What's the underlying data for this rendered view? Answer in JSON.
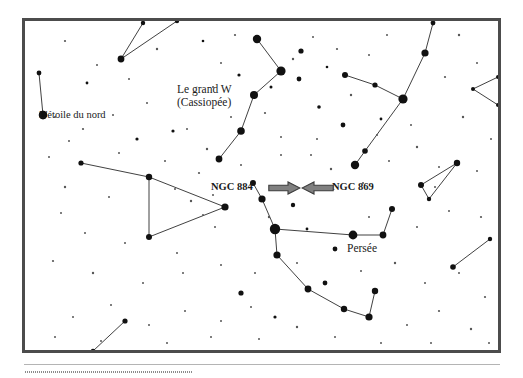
{
  "figure": {
    "kind": "star-chart",
    "language": "fr",
    "frame_border_color": "#4c4c4c",
    "background_color": "#ffffff",
    "star_color": "#111111",
    "constellation_line_color": "#2b2b2b",
    "arrow_fill_color": "#808080",
    "arrow_stroke_color": "#3c3c3c"
  },
  "labels": {
    "polaris": "L'étoile du nord",
    "cassiopeia_line1": "Le grand W",
    "cassiopeia_line2": "(Cassiopée)",
    "perseus": "Persée",
    "ngc884": "NGC 884",
    "ngc869": "NGC 869"
  },
  "chart_data": {
    "type": "scatter",
    "title": "",
    "subtitle": "",
    "xlabel": "",
    "ylabel": "",
    "xlim": [
      0,
      473
    ],
    "ylim": [
      0,
      329
    ],
    "grid": false,
    "legend": "none",
    "annotations": [
      {
        "text": "L'étoile du nord",
        "x": 18,
        "y": 86,
        "anchor": "star-polaris"
      },
      {
        "text": "Le grand W",
        "x": 140,
        "y": 60,
        "anchor": "constellation-cassiopeia"
      },
      {
        "text": "(Cassiopée)",
        "x": 140,
        "y": 74,
        "anchor": "constellation-cassiopeia"
      },
      {
        "text": "Persée",
        "x": 308,
        "y": 220,
        "anchor": "constellation-perseus"
      },
      {
        "text": "NGC 884",
        "x": 172,
        "y": 160,
        "anchor": "arrow-right"
      },
      {
        "text": "NGC 869",
        "x": 292,
        "y": 160,
        "anchor": "arrow-left"
      }
    ],
    "markers": {
      "named_stars": [
        {
          "name": "Polaris",
          "label": "L'étoile du nord",
          "x": 18,
          "y": 94,
          "size": 4.2
        }
      ]
    },
    "series": [
      {
        "name": "Cassiopée",
        "type": "constellation",
        "stars": [
          {
            "x": 232,
            "y": 18,
            "size": 4.2
          },
          {
            "x": 256,
            "y": 50,
            "size": 4.6
          },
          {
            "x": 229,
            "y": 74,
            "size": 4.0
          },
          {
            "x": 216,
            "y": 110,
            "size": 3.8
          },
          {
            "x": 194,
            "y": 138,
            "size": 3.4
          }
        ],
        "lines": [
          [
            0,
            1
          ],
          [
            1,
            2
          ],
          [
            2,
            3
          ],
          [
            3,
            4
          ]
        ]
      },
      {
        "name": "Persée",
        "type": "constellation",
        "stars": [
          {
            "x": 228,
            "y": 162,
            "size": 3.0
          },
          {
            "x": 237,
            "y": 178,
            "size": 3.6
          },
          {
            "x": 250,
            "y": 208,
            "size": 5.2
          },
          {
            "x": 328,
            "y": 214,
            "size": 4.4
          },
          {
            "x": 358,
            "y": 214,
            "size": 3.4
          },
          {
            "x": 367,
            "y": 188,
            "size": 3.0
          },
          {
            "x": 252,
            "y": 234,
            "size": 3.6
          },
          {
            "x": 283,
            "y": 268,
            "size": 3.4
          },
          {
            "x": 319,
            "y": 288,
            "size": 3.2
          },
          {
            "x": 344,
            "y": 296,
            "size": 3.6
          },
          {
            "x": 350,
            "y": 270,
            "size": 3.2
          }
        ],
        "lines": [
          [
            0,
            1
          ],
          [
            1,
            2
          ],
          [
            2,
            3
          ],
          [
            3,
            4
          ],
          [
            4,
            5
          ],
          [
            2,
            6
          ],
          [
            6,
            7
          ],
          [
            7,
            8
          ],
          [
            8,
            9
          ],
          [
            9,
            10
          ]
        ]
      },
      {
        "name": "Andromède",
        "type": "constellation",
        "stars": [
          {
            "x": 56,
            "y": 142,
            "size": 2.6
          },
          {
            "x": 124,
            "y": 156,
            "size": 3.2
          },
          {
            "x": 200,
            "y": 186,
            "size": 3.6
          },
          {
            "x": 124,
            "y": 216,
            "size": 3.0
          }
        ],
        "lines": [
          [
            0,
            1
          ],
          [
            1,
            2
          ],
          [
            2,
            3
          ],
          [
            3,
            1
          ]
        ]
      },
      {
        "name": "Nord-ouest",
        "type": "constellation",
        "stars": [
          {
            "x": 14,
            "y": 52,
            "size": 2.4
          },
          {
            "x": 18,
            "y": 94,
            "size": 4.2
          }
        ],
        "lines": [
          [
            0,
            1
          ]
        ]
      },
      {
        "name": "Haut-centre",
        "type": "constellation",
        "stars": [
          {
            "x": 118,
            "y": 2,
            "size": 2.2
          },
          {
            "x": 96,
            "y": 38,
            "size": 3.4
          },
          {
            "x": 152,
            "y": 0,
            "size": 2.2
          }
        ],
        "lines": [
          [
            0,
            1
          ],
          [
            1,
            2
          ]
        ]
      },
      {
        "name": "Nord-est",
        "type": "constellation",
        "stars": [
          {
            "x": 408,
            "y": 2,
            "size": 2.4
          },
          {
            "x": 400,
            "y": 32,
            "size": 3.6
          },
          {
            "x": 378,
            "y": 78,
            "size": 4.6
          },
          {
            "x": 340,
            "y": 130,
            "size": 2.8
          },
          {
            "x": 330,
            "y": 144,
            "size": 4.2
          },
          {
            "x": 320,
            "y": 54,
            "size": 3.0
          },
          {
            "x": 350,
            "y": 64,
            "size": 2.6
          }
        ],
        "lines": [
          [
            0,
            1
          ],
          [
            1,
            2
          ],
          [
            2,
            3
          ],
          [
            3,
            4
          ],
          [
            2,
            6
          ],
          [
            6,
            5
          ]
        ]
      },
      {
        "name": "Est-triangle",
        "type": "constellation",
        "stars": [
          {
            "x": 432,
            "y": 142,
            "size": 3.2
          },
          {
            "x": 396,
            "y": 164,
            "size": 3.0
          },
          {
            "x": 404,
            "y": 178,
            "size": 2.2
          }
        ],
        "lines": [
          [
            0,
            1
          ],
          [
            1,
            2
          ],
          [
            2,
            0
          ]
        ]
      },
      {
        "name": "Est-bas",
        "type": "constellation",
        "stars": [
          {
            "x": 465,
            "y": 218,
            "size": 2.2
          },
          {
            "x": 428,
            "y": 246,
            "size": 2.8
          }
        ],
        "lines": [
          [
            0,
            1
          ]
        ]
      },
      {
        "name": "Sud-ouest",
        "type": "constellation",
        "stars": [
          {
            "x": 100,
            "y": 300,
            "size": 2.6
          },
          {
            "x": 68,
            "y": 330,
            "size": 2.2
          }
        ],
        "lines": [
          [
            0,
            1
          ]
        ]
      },
      {
        "name": "Est-bord",
        "type": "constellation",
        "stars": [
          {
            "x": 473,
            "y": 56,
            "size": 2.0
          },
          {
            "x": 448,
            "y": 68,
            "size": 2.0
          },
          {
            "x": 473,
            "y": 84,
            "size": 2.0
          }
        ],
        "lines": [
          [
            0,
            1
          ],
          [
            1,
            2
          ]
        ]
      }
    ],
    "background_stars": [
      {
        "x": 40,
        "y": 20,
        "size": 1.1
      },
      {
        "x": 72,
        "y": 44,
        "size": 1.0
      },
      {
        "x": 62,
        "y": 62,
        "size": 1.4
      },
      {
        "x": 104,
        "y": 58,
        "size": 1.0
      },
      {
        "x": 132,
        "y": 28,
        "size": 1.2
      },
      {
        "x": 178,
        "y": 20,
        "size": 1.3
      },
      {
        "x": 196,
        "y": 42,
        "size": 1.0
      },
      {
        "x": 210,
        "y": 14,
        "size": 1.1
      },
      {
        "x": 214,
        "y": 54,
        "size": 1.6
      },
      {
        "x": 246,
        "y": 66,
        "size": 1.5
      },
      {
        "x": 268,
        "y": 38,
        "size": 1.2
      },
      {
        "x": 274,
        "y": 58,
        "size": 2.4
      },
      {
        "x": 288,
        "y": 16,
        "size": 1.0
      },
      {
        "x": 276,
        "y": 30,
        "size": 2.6
      },
      {
        "x": 302,
        "y": 46,
        "size": 1.3
      },
      {
        "x": 312,
        "y": 28,
        "size": 1.1
      },
      {
        "x": 326,
        "y": 74,
        "size": 1.2
      },
      {
        "x": 294,
        "y": 86,
        "size": 1.8
      },
      {
        "x": 318,
        "y": 104,
        "size": 2.4
      },
      {
        "x": 356,
        "y": 98,
        "size": 1.4
      },
      {
        "x": 386,
        "y": 104,
        "size": 1.0
      },
      {
        "x": 420,
        "y": 56,
        "size": 1.1
      },
      {
        "x": 438,
        "y": 96,
        "size": 1.2
      },
      {
        "x": 452,
        "y": 42,
        "size": 1.0
      },
      {
        "x": 466,
        "y": 118,
        "size": 1.0
      },
      {
        "x": 30,
        "y": 96,
        "size": 1.0
      },
      {
        "x": 58,
        "y": 108,
        "size": 1.1
      },
      {
        "x": 88,
        "y": 94,
        "size": 1.0
      },
      {
        "x": 112,
        "y": 118,
        "size": 1.6
      },
      {
        "x": 148,
        "y": 110,
        "size": 1.6
      },
      {
        "x": 162,
        "y": 108,
        "size": 1.0
      },
      {
        "x": 182,
        "y": 128,
        "size": 1.2
      },
      {
        "x": 206,
        "y": 96,
        "size": 1.0
      },
      {
        "x": 240,
        "y": 92,
        "size": 1.1
      },
      {
        "x": 256,
        "y": 116,
        "size": 1.0
      },
      {
        "x": 174,
        "y": 152,
        "size": 1.1
      },
      {
        "x": 140,
        "y": 140,
        "size": 1.0
      },
      {
        "x": 94,
        "y": 132,
        "size": 1.0
      },
      {
        "x": 24,
        "y": 136,
        "size": 1.0
      },
      {
        "x": 40,
        "y": 166,
        "size": 1.2
      },
      {
        "x": 84,
        "y": 176,
        "size": 1.0
      },
      {
        "x": 150,
        "y": 168,
        "size": 1.0
      },
      {
        "x": 166,
        "y": 180,
        "size": 1.2
      },
      {
        "x": 178,
        "y": 194,
        "size": 1.0
      },
      {
        "x": 188,
        "y": 174,
        "size": 1.0
      },
      {
        "x": 216,
        "y": 144,
        "size": 1.0
      },
      {
        "x": 306,
        "y": 148,
        "size": 1.2
      },
      {
        "x": 338,
        "y": 162,
        "size": 1.0
      },
      {
        "x": 364,
        "y": 140,
        "size": 1.0
      },
      {
        "x": 392,
        "y": 126,
        "size": 1.2
      },
      {
        "x": 414,
        "y": 146,
        "size": 1.0
      },
      {
        "x": 452,
        "y": 150,
        "size": 1.0
      },
      {
        "x": 268,
        "y": 184,
        "size": 2.2
      },
      {
        "x": 244,
        "y": 196,
        "size": 1.2
      },
      {
        "x": 282,
        "y": 208,
        "size": 1.4
      },
      {
        "x": 310,
        "y": 228,
        "size": 2.4
      },
      {
        "x": 344,
        "y": 196,
        "size": 1.0
      },
      {
        "x": 392,
        "y": 206,
        "size": 1.0
      },
      {
        "x": 424,
        "y": 190,
        "size": 1.0
      },
      {
        "x": 456,
        "y": 196,
        "size": 1.1
      },
      {
        "x": 190,
        "y": 206,
        "size": 1.0
      },
      {
        "x": 152,
        "y": 232,
        "size": 1.0
      },
      {
        "x": 100,
        "y": 222,
        "size": 1.0
      },
      {
        "x": 60,
        "y": 212,
        "size": 1.0
      },
      {
        "x": 36,
        "y": 192,
        "size": 1.0
      },
      {
        "x": 28,
        "y": 240,
        "size": 1.1
      },
      {
        "x": 68,
        "y": 252,
        "size": 1.2
      },
      {
        "x": 118,
        "y": 262,
        "size": 1.0
      },
      {
        "x": 158,
        "y": 252,
        "size": 1.0
      },
      {
        "x": 196,
        "y": 244,
        "size": 1.0
      },
      {
        "x": 230,
        "y": 252,
        "size": 1.0
      },
      {
        "x": 216,
        "y": 272,
        "size": 2.6
      },
      {
        "x": 272,
        "y": 242,
        "size": 1.0
      },
      {
        "x": 300,
        "y": 262,
        "size": 2.4
      },
      {
        "x": 336,
        "y": 250,
        "size": 1.0
      },
      {
        "x": 370,
        "y": 242,
        "size": 1.2
      },
      {
        "x": 400,
        "y": 262,
        "size": 1.0
      },
      {
        "x": 434,
        "y": 252,
        "size": 1.0
      },
      {
        "x": 460,
        "y": 276,
        "size": 1.1
      },
      {
        "x": 250,
        "y": 296,
        "size": 1.6
      },
      {
        "x": 226,
        "y": 286,
        "size": 1.0
      },
      {
        "x": 196,
        "y": 300,
        "size": 1.0
      },
      {
        "x": 160,
        "y": 290,
        "size": 1.0
      },
      {
        "x": 124,
        "y": 304,
        "size": 1.0
      },
      {
        "x": 86,
        "y": 284,
        "size": 1.0
      },
      {
        "x": 48,
        "y": 296,
        "size": 1.0
      },
      {
        "x": 30,
        "y": 316,
        "size": 1.0
      },
      {
        "x": 76,
        "y": 320,
        "size": 1.0
      },
      {
        "x": 142,
        "y": 322,
        "size": 1.0
      },
      {
        "x": 186,
        "y": 316,
        "size": 1.0
      },
      {
        "x": 234,
        "y": 318,
        "size": 1.0
      },
      {
        "x": 272,
        "y": 306,
        "size": 1.2
      },
      {
        "x": 310,
        "y": 316,
        "size": 1.0
      },
      {
        "x": 382,
        "y": 304,
        "size": 1.0
      },
      {
        "x": 414,
        "y": 290,
        "size": 1.1
      },
      {
        "x": 446,
        "y": 308,
        "size": 1.2
      },
      {
        "x": 464,
        "y": 322,
        "size": 1.0
      },
      {
        "x": 356,
        "y": 322,
        "size": 1.0
      },
      {
        "x": 406,
        "y": 322,
        "size": 1.0
      },
      {
        "x": 122,
        "y": 82,
        "size": 1.0
      },
      {
        "x": 44,
        "y": 120,
        "size": 1.0
      },
      {
        "x": 292,
        "y": 118,
        "size": 1.0
      },
      {
        "x": 352,
        "y": 114,
        "size": 1.0
      },
      {
        "x": 410,
        "y": 166,
        "size": 1.0
      },
      {
        "x": 188,
        "y": 66,
        "size": 1.0
      },
      {
        "x": 344,
        "y": 34,
        "size": 1.0
      },
      {
        "x": 362,
        "y": 14,
        "size": 1.0
      },
      {
        "x": 434,
        "y": 14,
        "size": 1.2
      },
      {
        "x": 256,
        "y": 134,
        "size": 1.0
      },
      {
        "x": 286,
        "y": 134,
        "size": 1.0
      }
    ]
  }
}
